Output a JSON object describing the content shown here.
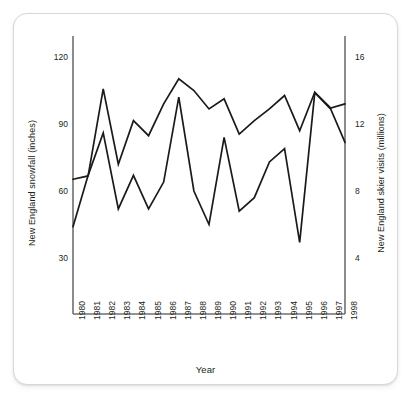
{
  "figure": {
    "x_axis": {
      "label": "Year",
      "tick_labels": [
        "1980",
        "1981",
        "1982",
        "1983",
        "1984",
        "1985",
        "1986",
        "1987",
        "1988",
        "1989",
        "1990",
        "1991",
        "1992",
        "1993",
        "1994",
        "1995",
        "1996",
        "1997",
        "1998"
      ]
    },
    "y_axis_left": {
      "label": "New England snowfall (inches)",
      "tick_labels": [
        "30",
        "60",
        "90",
        "120"
      ]
    },
    "y_axis_right": {
      "label": "New England skier visits (millions)",
      "tick_labels": [
        "4",
        "8",
        "12",
        "16"
      ]
    },
    "colors": {
      "line": "#1a1a1a",
      "axis": "#6f6f6f",
      "text": "#231f20",
      "card_background": "#ffffff",
      "card_border": "#d8d8d8"
    }
  },
  "chart_data": {
    "type": "line",
    "title": "",
    "xlabel": "Year",
    "ylabel": "New England snowfall (inches)",
    "y2label": "New England skier visits (millions)",
    "grid": false,
    "legend": "none",
    "x": [
      1980,
      1981,
      1982,
      1983,
      1984,
      1985,
      1986,
      1987,
      1988,
      1989,
      1990,
      1991,
      1992,
      1993,
      1994,
      1995,
      1996,
      1997,
      1998
    ],
    "xlim": [
      1980,
      1998
    ],
    "ylim": [
      15,
      135
    ],
    "y2lim": [
      2,
      18
    ],
    "ytick_values": [
      30,
      60,
      90,
      120
    ],
    "y2tick_values": [
      4,
      8,
      12,
      16
    ],
    "series": [
      {
        "name": "New England snowfall (inches)",
        "axis": "left",
        "units": "inches",
        "values": [
          44,
          67,
          86,
          52,
          67,
          52,
          64,
          102,
          60,
          45,
          84,
          51,
          57,
          73,
          79,
          37,
          104,
          97,
          99
        ]
      },
      {
        "name": "New England skier visits (millions)",
        "axis": "right",
        "units": "millions",
        "values": [
          8.7,
          8.9,
          14.1,
          9.6,
          12.2,
          11.3,
          13.2,
          14.7,
          14.0,
          12.9,
          13.5,
          11.4,
          12.2,
          12.9,
          13.7,
          11.6,
          13.9,
          13.0,
          10.9
        ]
      }
    ]
  }
}
